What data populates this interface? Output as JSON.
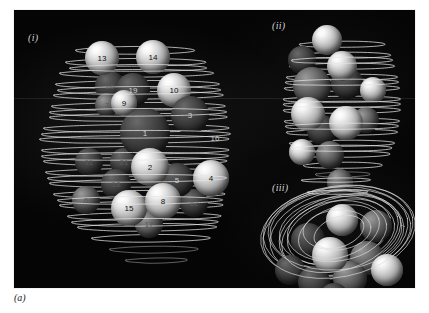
{
  "figure": {
    "caption": "(a)",
    "background_color": "#ffffff",
    "panel_color": "#050505",
    "stroke_color": "#e6e6e6"
  },
  "panels": [
    {
      "id": "i",
      "tag": "(i)",
      "view": "front view",
      "labeled": true
    },
    {
      "id": "ii",
      "tag": "(ii)",
      "view": "side view",
      "labeled": false
    },
    {
      "id": "iii",
      "tag": "(iii)",
      "view": "top-down view",
      "labeled": false
    }
  ],
  "panel_i": {
    "spheres": [
      {
        "label": "13",
        "x": 88,
        "y": 48,
        "r": 17,
        "shade": "bright",
        "label_color": "dark"
      },
      {
        "label": "14",
        "x": 139,
        "y": 47,
        "r": 17,
        "shade": "bright",
        "label_color": "dark"
      },
      {
        "label": "19",
        "x": 119,
        "y": 80,
        "r": 17,
        "shade": "dark",
        "label_color": "light"
      },
      {
        "label": "10",
        "x": 160,
        "y": 80,
        "r": 17,
        "shade": "bright",
        "label_color": "dark"
      },
      {
        "label": "20",
        "x": 96,
        "y": 76,
        "r": 15,
        "shade": "dark",
        "label_color": "faint"
      },
      {
        "label": "7",
        "x": 93,
        "y": 95,
        "r": 12,
        "shade": "dim",
        "label_color": "faint"
      },
      {
        "label": "9",
        "x": 110,
        "y": 93,
        "r": 13,
        "shade": "bright",
        "label_color": "dark"
      },
      {
        "label": "3",
        "x": 176,
        "y": 105,
        "r": 19,
        "shade": "dark",
        "label_color": "light"
      },
      {
        "label": "1",
        "x": 131,
        "y": 123,
        "r": 25,
        "shade": "dark",
        "label_color": "light"
      },
      {
        "label": "16",
        "x": 201,
        "y": 128,
        "r": 0,
        "shade": "none",
        "label_color": "light"
      },
      {
        "label": "2",
        "x": 136,
        "y": 157,
        "r": 19,
        "shade": "bright",
        "label_color": "dark"
      },
      {
        "label": "11",
        "x": 75,
        "y": 152,
        "r": 14,
        "shade": "dark",
        "label_color": "faint"
      },
      {
        "label": "21",
        "x": 110,
        "y": 152,
        "r": 14,
        "shade": "dark",
        "label_color": "faint"
      },
      {
        "label": "5",
        "x": 163,
        "y": 170,
        "r": 17,
        "shade": "dark",
        "label_color": "light"
      },
      {
        "label": "4",
        "x": 197,
        "y": 168,
        "r": 18,
        "shade": "bright",
        "label_color": "dark"
      },
      {
        "label": "18",
        "x": 102,
        "y": 174,
        "r": 15,
        "shade": "dark",
        "label_color": "faint"
      },
      {
        "label": "6",
        "x": 72,
        "y": 190,
        "r": 14,
        "shade": "dim",
        "label_color": "faint"
      },
      {
        "label": "15",
        "x": 115,
        "y": 198,
        "r": 18,
        "shade": "bright",
        "label_color": "dark"
      },
      {
        "label": "8",
        "x": 149,
        "y": 191,
        "r": 18,
        "shade": "bright",
        "label_color": "dark"
      },
      {
        "label": "12",
        "x": 180,
        "y": 193,
        "r": 14,
        "shade": "dark",
        "label_color": "faint"
      },
      {
        "label": "17",
        "x": 135,
        "y": 214,
        "r": 14,
        "shade": "dim",
        "label_color": "faint"
      }
    ],
    "sphere_count": 21
  },
  "panel_ii": {
    "spheres": [
      {
        "x": 77,
        "y": 30,
        "r": 15,
        "shade": "bright"
      },
      {
        "x": 52,
        "y": 50,
        "r": 14,
        "shade": "dark"
      },
      {
        "x": 92,
        "y": 56,
        "r": 15,
        "shade": "bright"
      },
      {
        "x": 62,
        "y": 76,
        "r": 19,
        "shade": "dim"
      },
      {
        "x": 97,
        "y": 73,
        "r": 16,
        "shade": "dark"
      },
      {
        "x": 123,
        "y": 80,
        "r": 13,
        "shade": "bright"
      },
      {
        "x": 58,
        "y": 104,
        "r": 17,
        "shade": "bright"
      },
      {
        "x": 96,
        "y": 113,
        "r": 17,
        "shade": "bright"
      },
      {
        "x": 72,
        "y": 120,
        "r": 15,
        "shade": "dark"
      },
      {
        "x": 116,
        "y": 110,
        "r": 13,
        "shade": "dim"
      },
      {
        "x": 52,
        "y": 142,
        "r": 13,
        "shade": "bright"
      },
      {
        "x": 80,
        "y": 145,
        "r": 14,
        "shade": "dim"
      },
      {
        "x": 90,
        "y": 172,
        "r": 13,
        "shade": "dim"
      }
    ],
    "sphere_count": 13
  },
  "panel_iii": {
    "spheres": [
      {
        "x": 58,
        "y": 70,
        "r": 17,
        "shade": "dark"
      },
      {
        "x": 92,
        "y": 50,
        "r": 16,
        "shade": "bright"
      },
      {
        "x": 126,
        "y": 56,
        "r": 16,
        "shade": "dim"
      },
      {
        "x": 40,
        "y": 100,
        "r": 15,
        "shade": "dark"
      },
      {
        "x": 80,
        "y": 85,
        "r": 18,
        "shade": "bright"
      },
      {
        "x": 117,
        "y": 88,
        "r": 17,
        "shade": "dim"
      },
      {
        "x": 64,
        "y": 112,
        "r": 16,
        "shade": "dark"
      },
      {
        "x": 100,
        "y": 108,
        "r": 17,
        "shade": "dim"
      },
      {
        "x": 137,
        "y": 100,
        "r": 16,
        "shade": "bright"
      },
      {
        "x": 84,
        "y": 128,
        "r": 15,
        "shade": "dark"
      }
    ],
    "sphere_count": 10,
    "loop_count": 14
  }
}
